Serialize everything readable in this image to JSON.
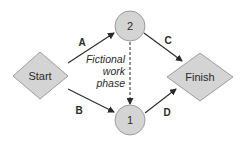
{
  "diagram": {
    "type": "activity-network",
    "colors": {
      "node_fill": "#d4d4d4",
      "node_stroke": "#8a8a8a",
      "edge": "#2a2a2a",
      "text": "#2a2a2a"
    },
    "nodes": [
      {
        "id": "start",
        "shape": "diamond",
        "label": "Start"
      },
      {
        "id": "n2",
        "shape": "circle",
        "label": "2"
      },
      {
        "id": "n1",
        "shape": "circle",
        "label": "1"
      },
      {
        "id": "finish",
        "shape": "diamond",
        "label": "Finish"
      }
    ],
    "edges": [
      {
        "from": "start",
        "to": "n2",
        "label": "A",
        "style": "solid"
      },
      {
        "from": "start",
        "to": "n1",
        "label": "B",
        "style": "solid"
      },
      {
        "from": "n2",
        "to": "finish",
        "label": "C",
        "style": "solid"
      },
      {
        "from": "n1",
        "to": "finish",
        "label": "D",
        "style": "solid"
      },
      {
        "from": "n2",
        "to": "n1",
        "label": "",
        "style": "dashed"
      }
    ],
    "annotation": {
      "lines": [
        "Fictional",
        "work",
        "phase"
      ]
    }
  }
}
